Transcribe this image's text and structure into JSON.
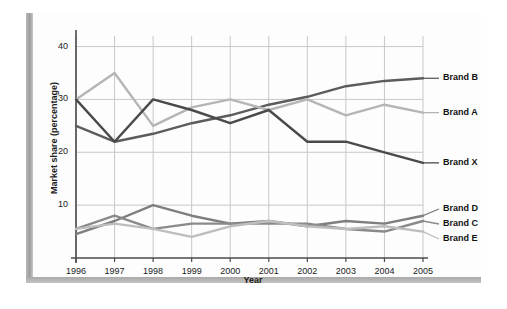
{
  "chart_data": {
    "type": "line",
    "title": "",
    "xlabel": "Year",
    "ylabel": "Market share (percentage)",
    "x": [
      1996,
      1997,
      1998,
      1999,
      2000,
      2001,
      2002,
      2003,
      2004,
      2005
    ],
    "categories": [
      "1996",
      "1997",
      "1998",
      "1999",
      "2000",
      "2001",
      "2002",
      "2003",
      "2004",
      "2005"
    ],
    "xlim": [
      1996,
      2005
    ],
    "ylim": [
      0,
      42
    ],
    "yticks": [
      10,
      20,
      30,
      40
    ],
    "ytick_labels": [
      "10",
      "20",
      "30",
      "40"
    ],
    "grid": true,
    "legend_position": "right-inline",
    "series": [
      {
        "name": "Brand B",
        "color": "#5c5c5c",
        "values": [
          25,
          22,
          23.5,
          25.5,
          27,
          29,
          30.5,
          32.5,
          33.5,
          34
        ]
      },
      {
        "name": "Brand A",
        "color": "#b5b5b5",
        "values": [
          30,
          35,
          25,
          28.5,
          30,
          28,
          30,
          27,
          29,
          27.5
        ]
      },
      {
        "name": "Brand X",
        "color": "#4a4a4a",
        "values": [
          30,
          22,
          30,
          28,
          25.5,
          28,
          22,
          22,
          20,
          18
        ]
      },
      {
        "name": "Brand D",
        "color": "#7e7e7e",
        "values": [
          4.5,
          7,
          10,
          8,
          6.5,
          7,
          6,
          7,
          6.5,
          8
        ]
      },
      {
        "name": "Brand C",
        "color": "#8a8a8a",
        "values": [
          5.5,
          8,
          5.5,
          6.5,
          6.5,
          6.5,
          6.5,
          5.5,
          5,
          7
        ]
      },
      {
        "name": "Brand E",
        "color": "#bdbdbd",
        "values": [
          5.5,
          6.5,
          5.5,
          4,
          6,
          7,
          6,
          5.5,
          6,
          5
        ]
      }
    ]
  },
  "labels": {
    "brand_b": "Brand B",
    "brand_a": "Brand A",
    "brand_x": "Brand X",
    "brand_d": "Brand D",
    "brand_c": "Brand C",
    "brand_e": "Brand E"
  },
  "ticks": {
    "y": [
      "40",
      "30",
      "20",
      "10"
    ],
    "x": [
      "1996",
      "1997",
      "1998",
      "1999",
      "2000",
      "2001",
      "2002",
      "2003",
      "2004",
      "2005"
    ]
  },
  "axes": {
    "x_title": "Year",
    "y_title": "Market share (percentage)"
  },
  "colors": {
    "grid": "#c8c8c8",
    "axis": "#4a4a4a",
    "frame": "#a9a9a9",
    "background": "#fdfdfd",
    "text": "#1b1b1b"
  }
}
